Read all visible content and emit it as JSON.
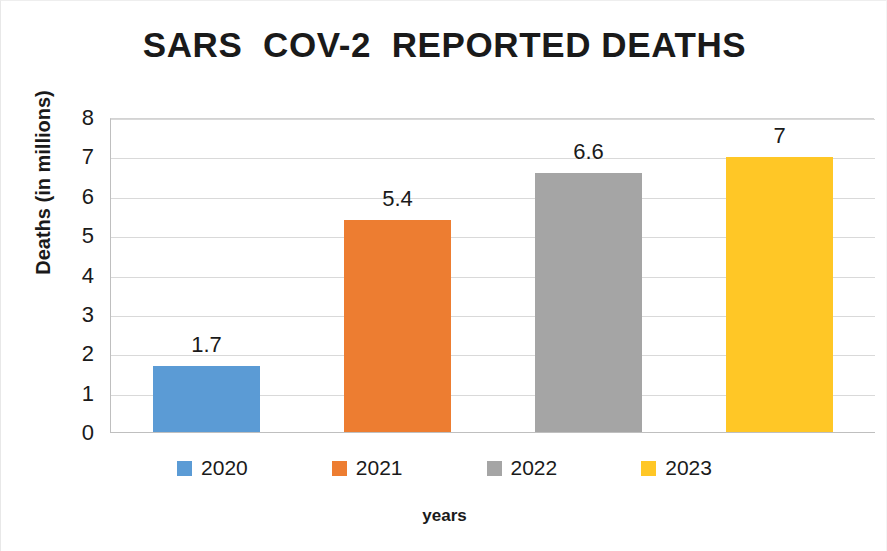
{
  "chart_data": {
    "type": "bar",
    "title": "SARS  COV-2  REPORTED DEATHS",
    "xlabel": "years",
    "ylabel": "Deaths (in millions)",
    "categories": [
      "2020",
      "2021",
      "2022",
      "2023"
    ],
    "values": [
      1.7,
      5.4,
      6.6,
      7
    ],
    "data_labels": [
      "1.7",
      "5.4",
      "6.6",
      "7"
    ],
    "colors": [
      "#5B9BD5",
      "#ED7D31",
      "#A5A5A5",
      "#FFC726"
    ],
    "ylim": [
      0,
      8
    ],
    "ytick_step": 1,
    "ytick_labels": [
      "8",
      "7",
      "6",
      "5",
      "4",
      "3",
      "2",
      "1",
      "0"
    ],
    "grid": "horizontal",
    "legend_position": "bottom",
    "legend": [
      {
        "label": "2020",
        "color": "#5B9BD5"
      },
      {
        "label": "2021",
        "color": "#ED7D31"
      },
      {
        "label": "2022",
        "color": "#A5A5A5"
      },
      {
        "label": "2023",
        "color": "#FFC726"
      }
    ]
  }
}
